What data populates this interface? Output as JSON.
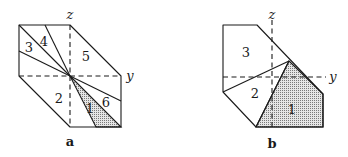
{
  "figures": [
    {
      "id": "a",
      "caption": "a",
      "axis_labels": {
        "z": "z",
        "y": "y"
      },
      "region_labels": [
        "1",
        "2",
        "3",
        "4",
        "5",
        "6"
      ],
      "shaded_regions": [
        "1"
      ]
    },
    {
      "id": "b",
      "caption": "b",
      "axis_labels": {
        "z": "z",
        "y": "y"
      },
      "region_labels": [
        "1",
        "2",
        "3"
      ],
      "shaded_regions": [
        "1"
      ]
    }
  ],
  "colors": {
    "line": "#1a1a1a",
    "shade_dot": "#555555",
    "background": "#ffffff"
  }
}
